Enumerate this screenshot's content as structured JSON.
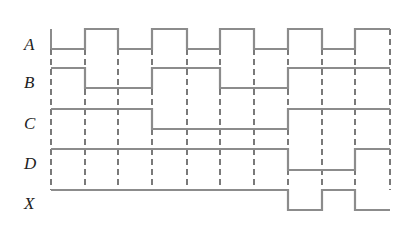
{
  "diagram": {
    "type": "timing-diagram",
    "colors": {
      "trace": "#8c8c8c",
      "grid": "#333333",
      "label": "#222222"
    },
    "grid_x": [
      51,
      85,
      118,
      152,
      187,
      220,
      254,
      288,
      322,
      355,
      390
    ],
    "signals": [
      {
        "name": "A",
        "label_y": 36,
        "high_y": 29,
        "low_y": 49,
        "levels": [
          0,
          1,
          0,
          1,
          0,
          1,
          0,
          1,
          0,
          1
        ]
      },
      {
        "name": "B",
        "label_y": 74,
        "high_y": 68,
        "low_y": 88,
        "levels": [
          1,
          0,
          0,
          1,
          1,
          0,
          0,
          1,
          1,
          1
        ]
      },
      {
        "name": "C",
        "label_y": 115,
        "high_y": 109,
        "low_y": 129,
        "levels": [
          1,
          1,
          1,
          0,
          0,
          0,
          0,
          1,
          1,
          1
        ]
      },
      {
        "name": "D",
        "label_y": 155,
        "high_y": 149,
        "low_y": 170,
        "levels": [
          1,
          1,
          1,
          1,
          1,
          1,
          1,
          0,
          0,
          1
        ]
      },
      {
        "name": "X",
        "label_y": 195,
        "high_y": 190,
        "low_y": 210,
        "levels": [
          1,
          1,
          1,
          1,
          1,
          1,
          1,
          0,
          1,
          0
        ]
      }
    ]
  }
}
